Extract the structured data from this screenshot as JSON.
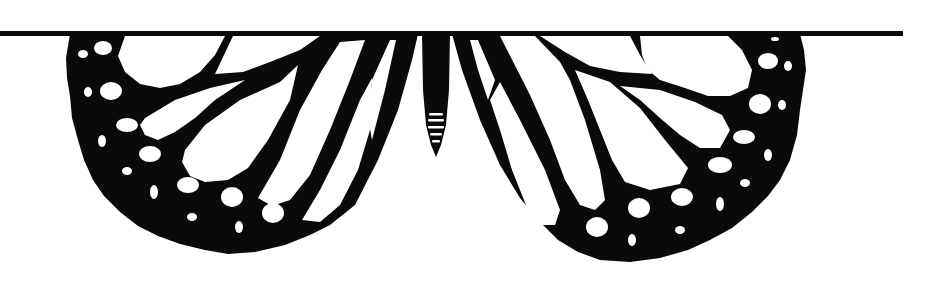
{
  "image": {
    "subject": "Monarch butterfly wings silhouette hanging below a horizontal line",
    "alt_text": "Black and white butterfly wings illustration",
    "colors": {
      "ink": "#0a0a0a",
      "background": "#ffffff"
    },
    "elements": {
      "line": "horizontal-rule",
      "left_wing": "left-wing",
      "right_wing": "right-wing",
      "body": "butterfly-abdomen"
    }
  }
}
